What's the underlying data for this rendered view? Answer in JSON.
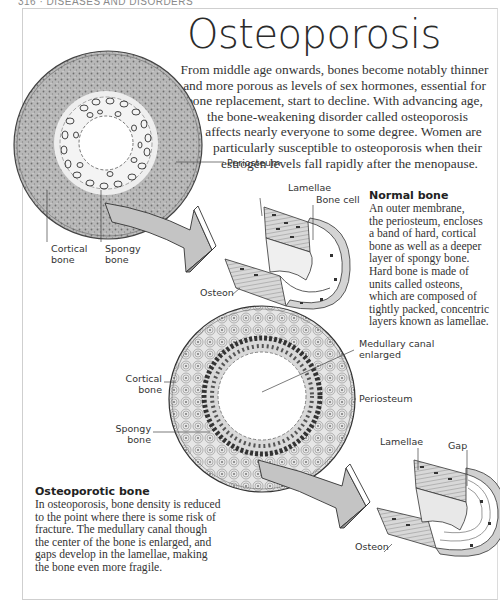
{
  "running_head": "316 · DISEASES AND DISORDERS",
  "title": "Osteoporosis",
  "intro_lines": [
    "From middle age onwards, bones become notably thinner",
    "and more porous as levels of sex hormones, essential for",
    "bone replacement, start to decline. With advancing age,",
    "the bone-weakening disorder called osteoporosis",
    "affects nearly everyone to some degree. Women are",
    "particularly susceptible to osteoporosis when their",
    "estrogen levels fall rapidly after the menopause."
  ],
  "normal_diagram": {
    "labels": {
      "periosteum": "Periosteum",
      "cortical": [
        "Cortical",
        "bone"
      ],
      "spongy": [
        "Spongy",
        "bone"
      ],
      "lamellae": "Lamellae",
      "bone_cell": "Bone cell",
      "osteon": "Osteon"
    },
    "heading": "Normal bone",
    "text_lines": [
      "An outer membrane,",
      "the periosteum, encloses",
      "a band of hard, cortical",
      "bone as well as a deeper",
      "layer of spongy bone.",
      "Hard bone is made of",
      "units called osteons,",
      "which are composed of",
      "tightly packed, concentric",
      "layers known as lamellae."
    ]
  },
  "osteoporotic_diagram": {
    "labels": {
      "medullary": [
        "Medullary canal",
        "enlarged"
      ],
      "cortical": [
        "Cortical",
        "bone"
      ],
      "spongy": [
        "Spongy",
        "bone"
      ],
      "periosteum": "Periosteum",
      "lamellae": "Lamellae",
      "gap": "Gap",
      "osteon": "Osteon"
    },
    "heading": "Osteoporotic bone",
    "text_lines": [
      "In osteoporosis, bone density is reduced",
      "to the point where there is some risk of",
      "fracture. The medullary canal though",
      "the center of the bone is enlarged, and",
      "gaps develop in the lamellae, making",
      "the bone even more fragile."
    ]
  },
  "colors": {
    "ink": "#2a2a2a",
    "bone_fill": "#bdbdbd",
    "arrow_fill": "#c4c4c4",
    "frame": "#cfcfcf"
  }
}
